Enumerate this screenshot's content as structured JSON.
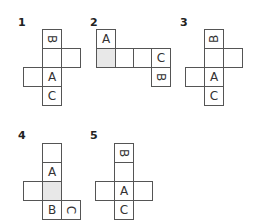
{
  "puzzles": [
    {
      "label": "1",
      "cells": [
        {
          "text": "B",
          "rotation": "90"
        },
        {
          "text": ""
        },
        {
          "text": ""
        },
        {
          "text": ""
        },
        {
          "text": "A"
        },
        {
          "text": "C"
        }
      ]
    },
    {
      "label": "2",
      "cells": [
        {
          "text": "A"
        },
        {
          "text": "",
          "shaded": true
        },
        {
          "text": ""
        },
        {
          "text": ""
        },
        {
          "text": "C"
        },
        {
          "text": "B",
          "rotation": "90"
        }
      ]
    },
    {
      "label": "3",
      "cells": [
        {
          "text": "B",
          "rotation": "-90"
        },
        {
          "text": ""
        },
        {
          "text": ""
        },
        {
          "text": ""
        },
        {
          "text": "A"
        },
        {
          "text": "C"
        }
      ]
    },
    {
      "label": "4",
      "cells": [
        {
          "text": ""
        },
        {
          "text": "A"
        },
        {
          "text": ""
        },
        {
          "text": "",
          "shaded": true
        },
        {
          "text": "B"
        },
        {
          "text": "C",
          "rotation": "90"
        }
      ]
    },
    {
      "label": "5",
      "cells": [
        {
          "text": "B",
          "rotation": "90"
        },
        {
          "text": ""
        },
        {
          "text": ""
        },
        {
          "text": "A"
        },
        {
          "text": ""
        },
        {
          "text": "C"
        }
      ]
    }
  ],
  "colors": {
    "border": "#555555",
    "shaded": "#e8e8e8",
    "text": "#333333"
  }
}
